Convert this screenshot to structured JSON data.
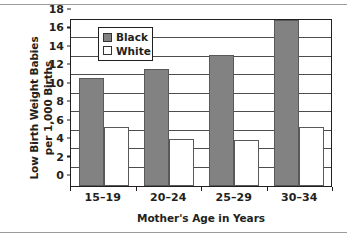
{
  "chart_data": {
    "type": "bar",
    "title": "",
    "subtitle": "",
    "categories": [
      "15–19",
      "20–24",
      "25–29",
      "30–34"
    ],
    "series": [
      {
        "name": "Black",
        "values": [
          11.6,
          12.5,
          14.0,
          17.8
        ],
        "color": "#828282"
      },
      {
        "name": "White",
        "values": [
          6.3,
          5.0,
          4.9,
          6.3
        ],
        "color": "#ffffff"
      }
    ],
    "xlabel": "Mother's Age in Years",
    "ylabel": "Low Birth Weight Babies per 1,000 Births",
    "ylabel_line1": "Low Birth Weight Babies",
    "ylabel_line2": "per 1,000 Births",
    "ylim": [
      0,
      18
    ],
    "yticks": [
      0,
      2,
      4,
      6,
      8,
      10,
      12,
      14,
      16,
      18
    ],
    "ytick_labels": [
      "0",
      "2",
      "4",
      "6",
      "8",
      "10",
      "12",
      "14",
      "16",
      "18"
    ],
    "grid": "horizontal",
    "legend_position": "upper-left-inside",
    "legend_entries": [
      "Black",
      "White"
    ]
  },
  "colors": {
    "black_series": "#828282",
    "white_series": "#ffffff",
    "axis": "#231f20",
    "gridline": "#4d4d4d",
    "page_rule": "#9b9b9b"
  }
}
